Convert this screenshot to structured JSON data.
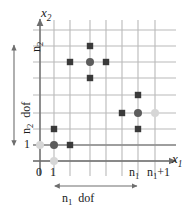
{
  "figure": {
    "background": "#ffffff",
    "width": 191,
    "height": 213
  },
  "axes": {
    "x_axis_label": "x",
    "x_axis_sub": "1",
    "y_axis_label": "x",
    "y_axis_sub": "2",
    "x_ticks": [
      {
        "label": "0",
        "sub": "",
        "plus": "",
        "x": 40
      },
      {
        "label": "1",
        "sub": "",
        "plus": "",
        "x": 54
      },
      {
        "label": "n",
        "sub": "1",
        "plus": "",
        "x": 138
      },
      {
        "label": "n",
        "sub": "1",
        "plus": "+1",
        "x": 155
      }
    ],
    "y_ticks": [
      {
        "label": "1",
        "sub": "",
        "y": 145
      },
      {
        "label": "n",
        "sub": "2",
        "y": 46
      }
    ]
  },
  "dimensions": {
    "horizontal": {
      "label": "n",
      "sub": "1",
      "suffix": "dof"
    },
    "vertical": {
      "label": "n",
      "sub": "2",
      "suffix": "dof"
    }
  },
  "colors": {
    "grid_line": "#b9b9b9",
    "axis_line": "#6e6e6e",
    "node_dark": "#3a3a3a",
    "node_center": "#5c5c5c",
    "node_ghost": "#d6d6d6",
    "text": "#1a1a1a"
  },
  "grid": {
    "vertical_lines_x": [
      40,
      54,
      70,
      90,
      106,
      122,
      138,
      155
    ],
    "horizontal_lines_y": [
      30,
      46,
      62,
      78,
      95,
      113,
      129,
      145,
      161
    ],
    "vertical_extent": {
      "top": 20,
      "bottom": 176
    },
    "horizontal_extent": {
      "left": 33,
      "right": 176
    }
  },
  "stencils": [
    {
      "name": "interior-stencil",
      "center": {
        "x": 90,
        "y": 62,
        "kind": "center"
      },
      "neighbors": [
        {
          "x": 90,
          "y": 46,
          "kind": "dark"
        },
        {
          "x": 90,
          "y": 78,
          "kind": "dark"
        },
        {
          "x": 70,
          "y": 62,
          "kind": "dark"
        },
        {
          "x": 106,
          "y": 62,
          "kind": "dark"
        }
      ]
    },
    {
      "name": "right-edge-stencil",
      "center": {
        "x": 138,
        "y": 113,
        "kind": "center"
      },
      "neighbors": [
        {
          "x": 138,
          "y": 95,
          "kind": "dark"
        },
        {
          "x": 138,
          "y": 129,
          "kind": "dark"
        },
        {
          "x": 122,
          "y": 113,
          "kind": "dark"
        },
        {
          "x": 155,
          "y": 113,
          "kind": "ghost"
        }
      ]
    },
    {
      "name": "corner-stencil",
      "center": {
        "x": 54,
        "y": 145,
        "kind": "center"
      },
      "neighbors": [
        {
          "x": 54,
          "y": 129,
          "kind": "dark"
        },
        {
          "x": 54,
          "y": 161,
          "kind": "ghost"
        },
        {
          "x": 40,
          "y": 145,
          "kind": "ghost"
        },
        {
          "x": 70,
          "y": 145,
          "kind": "dark"
        }
      ]
    }
  ]
}
